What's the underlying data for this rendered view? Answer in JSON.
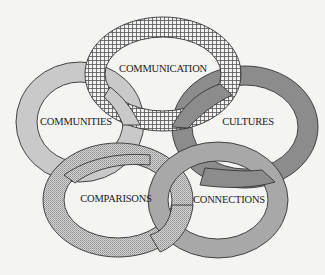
{
  "diagram": {
    "title": "",
    "type": "interlocking-rings",
    "background_color": "#f4f4f2",
    "rings": [
      {
        "id": "communication",
        "label": "COMMUNICATION",
        "position": "top",
        "fill": "crosshatch",
        "color": "#d9d9d9"
      },
      {
        "id": "communities",
        "label": "COMMUNITIES",
        "position": "left",
        "fill": "solid-light-gray",
        "color": "#c8c8c8"
      },
      {
        "id": "cultures",
        "label": "CULTURES",
        "position": "right",
        "fill": "solid-dark-gray",
        "color": "#8a8a8a"
      },
      {
        "id": "comparisons",
        "label": "COMPARISONS",
        "position": "bottom-left",
        "fill": "stipple",
        "color": "#bdbdbd"
      },
      {
        "id": "connections",
        "label": "CONNECTIONS",
        "position": "bottom-right",
        "fill": "solid-medium-gray",
        "color": "#a6a6a6"
      }
    ]
  }
}
